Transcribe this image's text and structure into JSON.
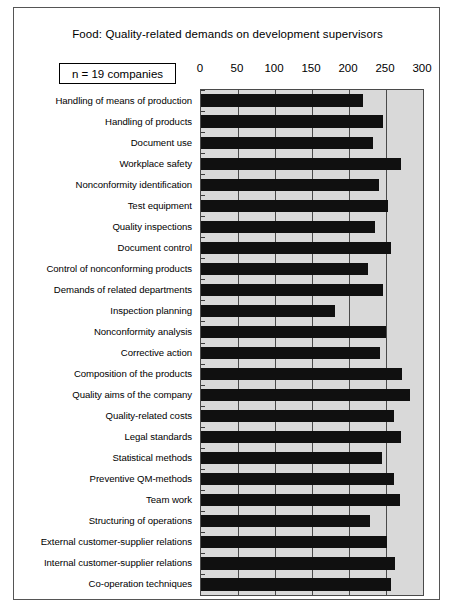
{
  "figure": {
    "title": "Food:  Quality-related demands on development supervisors",
    "sample_size_label": "n = 19 companies"
  },
  "chart_data": {
    "type": "bar",
    "orientation": "horizontal",
    "title": "Food:  Quality-related demands on development supervisors",
    "xlabel": "",
    "ylabel": "",
    "xlim": [
      0,
      300
    ],
    "xticks": [
      0,
      50,
      100,
      150,
      200,
      250,
      300
    ],
    "xtick_labels": [
      "0",
      "50",
      "100",
      "150",
      "200",
      "250",
      "300"
    ],
    "grid": true,
    "legend": false,
    "plot_background": "#d9d9d9",
    "bar_color": "#101010",
    "annotation": "n = 19 companies",
    "categories": [
      "Handling of means of production",
      "Handling of products",
      "Document use",
      "Workplace safety",
      "Nonconformity identification",
      "Test equipment",
      "Quality inspections",
      "Document control",
      "Control of nonconforming products",
      "Demands of related departments",
      "Inspection planning",
      "Nonconformity analysis",
      "Corrective action",
      "Composition of the  products",
      "Quality aims of the company",
      "Quality-related costs",
      "Legal standards",
      "Statistical methods",
      "Preventive QM-methods",
      "Team work",
      "Structuring of operations",
      "External customer-supplier relations",
      "Internal customer-supplier relations",
      "Co-operation techniques"
    ],
    "values": [
      219,
      246,
      232,
      270,
      240,
      253,
      235,
      257,
      225,
      246,
      181,
      250,
      242,
      272,
      282,
      261,
      270,
      244,
      261,
      269,
      229,
      251,
      262,
      257
    ]
  }
}
